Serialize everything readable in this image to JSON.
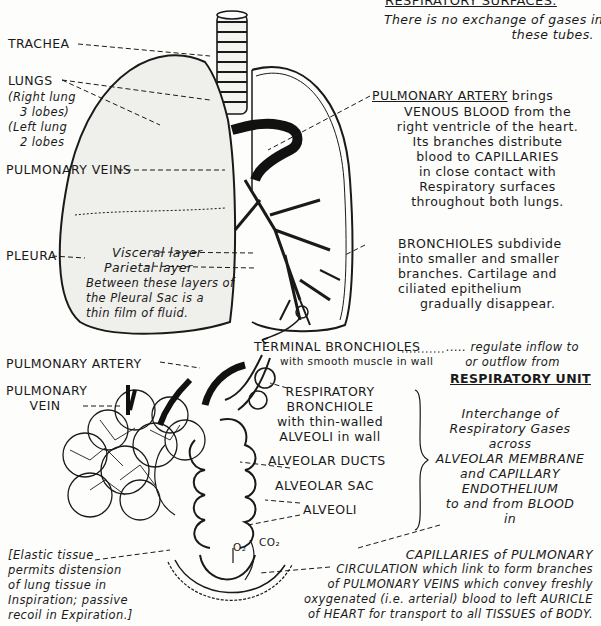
{
  "header": {
    "title": "RESPIRATORY SURFACES.",
    "note_lines": [
      "There is no exchange of gases in",
      "these tubes."
    ]
  },
  "upper_labels": {
    "trachea": "TRACHEA",
    "lungs": "LUNGS",
    "lungs_note": [
      "(Right lung",
      "3 lobes)",
      "(Left lung",
      "2 lobes"
    ],
    "pulmonary_veins": "PULMONARY VEINS",
    "pleura": "PLEURA",
    "visceral_layer": "Visceral layer",
    "parietal_layer": "Parietal layer",
    "pleura_note": [
      "Between these layers of",
      "the Pleural Sac is a",
      "thin film of fluid."
    ]
  },
  "pulmonary_artery_note": {
    "title": "PULMONARY ARTERY",
    "lines": [
      "brings",
      "VENOUS BLOOD from the",
      "right ventricle of the heart.",
      "Its branches distribute",
      "blood to CAPILLARIES",
      "in close contact with",
      "Respiratory surfaces",
      "throughout both lungs."
    ]
  },
  "bronchioles_note": {
    "lines": [
      "BRONCHIOLES subdivide",
      "into smaller and smaller",
      "branches. Cartilage and",
      "ciliated epithelium",
      "gradually disappear."
    ]
  },
  "lower_labels": {
    "pulmonary_artery": "PULMONARY ARTERY",
    "pulmonary_vein": [
      "PULMONARY",
      "VEIN"
    ],
    "terminal_bronchioles": "TERMINAL BRONCHIOLES",
    "terminal_bronchioles_sub": "with smooth muscle in wall",
    "respiratory_bronchiole": [
      "RESPIRATORY",
      "BRONCHIOLE",
      "with thin-walled",
      "ALVEOLI in wall"
    ],
    "alveolar_ducts": "ALVEOLAR DUCTS",
    "alveolar_sac": "ALVEOLAR SAC",
    "alveoli": "ALVEOLI",
    "o2": "O₂",
    "co2": "CO₂"
  },
  "respiratory_unit": {
    "regulate_lines": [
      "..... regulate inflow to",
      "or outflow from"
    ],
    "title": "RESPIRATORY UNIT",
    "interchange_lines": [
      "Interchange of",
      "Respiratory Gases",
      "across",
      "ALVEOLAR MEMBRANE",
      "and CAPILLARY",
      "ENDOTHELIUM",
      "to and from BLOOD",
      "in"
    ]
  },
  "elastic_note": {
    "lines": [
      "[Elastic tissue",
      "permits distension",
      "of lung tissue in",
      "Inspiration; passive",
      "recoil in Expiration.]"
    ]
  },
  "capillaries_note": {
    "lines": [
      "CAPILLARIES of PULMONARY",
      "CIRCULATION which link to form branches",
      "of PULMONARY VEINS which convey freshly",
      "oxygenated (i.e. arterial) blood to left AURICLE",
      "of HEART for transport to all TISSUES of BODY."
    ]
  },
  "colors": {
    "ink": "#1a1a1a",
    "paper": "#fdfdfb"
  }
}
